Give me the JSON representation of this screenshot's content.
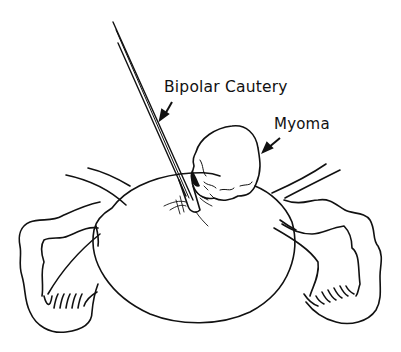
{
  "figure": {
    "labels": {
      "instrument": "Bipolar Cautery",
      "lesion": "Myoma"
    },
    "colors": {
      "line": "#111111",
      "background": "#ffffff"
    }
  }
}
